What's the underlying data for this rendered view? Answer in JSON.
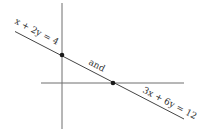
{
  "diagram": {
    "type": "coordinate-plane-line",
    "colors": {
      "axis": "#6e6e6e",
      "line": "#444444",
      "point": "#1a1a1a",
      "text": "#333333"
    },
    "labels": {
      "equation_top": "x + 2y = 4",
      "connector": "and",
      "equation_bottom": "3x + 6y = 12"
    },
    "points": [
      {
        "name": "y-intercept",
        "x": 62,
        "y": 55
      },
      {
        "name": "x-intercept",
        "x": 113,
        "y": 83
      }
    ]
  }
}
